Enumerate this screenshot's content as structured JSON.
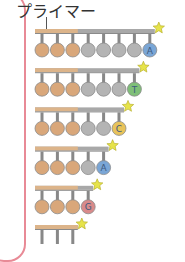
{
  "title": "プライマー",
  "colors": {
    "primer": "#dcb48a",
    "strand": "#a8a8a8",
    "template_ball": "#d9a77a",
    "gray_ball": "#b4b4b4",
    "frame": "#e88a96",
    "star": "#e6e34a",
    "A": "#7aa6d6",
    "T": "#7fbf78",
    "C": "#e8c35a",
    "G": "#d98a8a"
  },
  "rows": [
    {
      "length": 8,
      "terminal_base": "A"
    },
    {
      "length": 7,
      "terminal_base": "T"
    },
    {
      "length": 6,
      "terminal_base": "C"
    },
    {
      "length": 5,
      "terminal_base": "A"
    },
    {
      "length": 4,
      "terminal_base": "G"
    },
    {
      "length": 3,
      "terminal_base": ""
    }
  ],
  "primer_length": 3
}
